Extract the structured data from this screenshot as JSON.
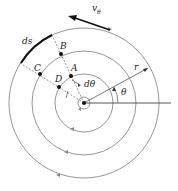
{
  "diagram": {
    "type": "polar-flow-field",
    "center": [
      84,
      103
    ],
    "circle_radii": [
      6,
      29,
      52,
      75
    ],
    "labels": {
      "velocity": "v",
      "velocity_sub": "θ",
      "arc_length": "ds",
      "point_a": "A",
      "point_b": "B",
      "point_c": "C",
      "point_d": "D",
      "dtheta": "dθ",
      "radius": "r",
      "theta": "θ"
    },
    "colors": {
      "circles": "#8a8a8a",
      "dark": "#111111"
    }
  }
}
